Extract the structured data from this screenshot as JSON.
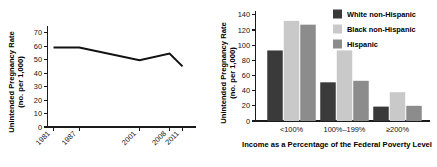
{
  "chart_data": [
    {
      "id": "unintended-pregnancy-rate-trend",
      "type": "line",
      "title": "",
      "xlabel": "",
      "ylabel": "Unintended Pregnancy Rate (no. per 1,000)",
      "ylabel_line1": "Unintended Pregnancy Rate",
      "ylabel_line2": "(no. per 1,000)",
      "x": [
        "1981",
        "1987",
        "2001",
        "2008",
        "2011"
      ],
      "x_numeric": [
        1981,
        1987,
        2001,
        2008,
        2011
      ],
      "values": [
        59,
        59,
        49.5,
        54.5,
        45
      ],
      "series": [
        {
          "name": "Unintended pregnancy rate",
          "values": [
            59,
            59,
            49.5,
            54.5,
            45
          ]
        }
      ],
      "ylim": [
        0,
        75
      ],
      "yticks": [
        0,
        10,
        20,
        30,
        40,
        50,
        60,
        70
      ],
      "ytick_labels": [
        "0",
        "10",
        "20",
        "30",
        "40",
        "50",
        "60",
        "70"
      ],
      "xtick_labels": [
        "1981",
        "1987",
        "2001",
        "2008",
        "2011"
      ],
      "grid": false,
      "legend": "none",
      "line_color": "#111111"
    },
    {
      "id": "unintended-pregnancy-rate-by-income-and-race",
      "type": "bar",
      "title": "",
      "xlabel": "Income as a Percentage of the Federal Poverty Level",
      "ylabel": "Unintended Pregnancy Rate (no. per 1,000)",
      "ylabel_line1": "Unintended Pregnancy Rate",
      "ylabel_line2": "(no. per 1,000)",
      "categories": [
        "<100%",
        "100%–199%",
        "≥200%"
      ],
      "series": [
        {
          "name": "White non-Hispanic",
          "color": "#3a3a3a",
          "values": [
            93,
            51,
            19
          ]
        },
        {
          "name": "Black non-Hispanic",
          "color": "#c9c9c9",
          "values": [
            132,
            93,
            38
          ]
        },
        {
          "name": "Hispanic",
          "color": "#8c8c8c",
          "values": [
            127,
            53,
            20
          ]
        }
      ],
      "ylim": [
        0,
        145
      ],
      "yticks": [
        0,
        20,
        40,
        60,
        80,
        100,
        120,
        140
      ],
      "ytick_labels": [
        "0",
        "20",
        "40",
        "60",
        "80",
        "100",
        "120",
        "140"
      ],
      "grid": false,
      "legend": "top-right",
      "legend_entries": [
        "White non-Hispanic",
        "Black non-Hispanic",
        "Hispanic"
      ]
    }
  ]
}
